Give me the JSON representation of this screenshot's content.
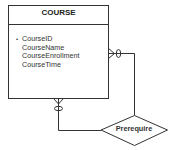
{
  "entity": {
    "name": "COURSE",
    "attributes": [
      {
        "name": "CourseID",
        "primary_key": true,
        "marker": "•"
      },
      {
        "name": "CourseName",
        "primary_key": false,
        "marker": ""
      },
      {
        "name": "CourseEnrollment",
        "primary_key": false,
        "marker": ""
      },
      {
        "name": "CourseTime",
        "primary_key": false,
        "marker": ""
      }
    ]
  },
  "relationship": {
    "name": "Prerequire",
    "type": "recursive",
    "cardinality": [
      "zero-or-many",
      "zero-or-many"
    ]
  },
  "colors": {
    "line": "#333333",
    "background": "#ffffff"
  }
}
